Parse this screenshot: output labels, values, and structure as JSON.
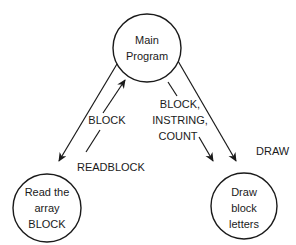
{
  "diagram": {
    "type": "structure-chart",
    "colors": {
      "ink": "#1a1a1a",
      "background": "#ffffff"
    },
    "nodes": [
      {
        "id": "main",
        "lines": [
          "Main",
          "Program"
        ],
        "cx": 147,
        "cy": 48,
        "r": 34
      },
      {
        "id": "read",
        "lines": [
          "Read the",
          "array",
          "BLOCK"
        ],
        "cx": 47,
        "cy": 208,
        "r": 34
      },
      {
        "id": "draw",
        "lines": [
          "Draw",
          "block",
          "letters"
        ],
        "cx": 244,
        "cy": 206,
        "r": 33
      }
    ],
    "edges": [
      {
        "from": "main",
        "to": "read",
        "label": "READBLOCK",
        "kind": "call"
      },
      {
        "from": "main",
        "to": "draw",
        "label": "DRAW",
        "kind": "call"
      }
    ],
    "data_flows": [
      {
        "label": "BLOCK",
        "direction": "read-to-main"
      },
      {
        "label_lines": [
          "BLOCK,",
          "INSTRING,",
          "COUNT"
        ],
        "direction": "main-to-draw"
      }
    ],
    "labels": {
      "block_up": "BLOCK",
      "readblock": "READBLOCK",
      "flow_to_draw": [
        "BLOCK,",
        "INSTRING,",
        "COUNT"
      ],
      "draw": "DRAW"
    }
  }
}
